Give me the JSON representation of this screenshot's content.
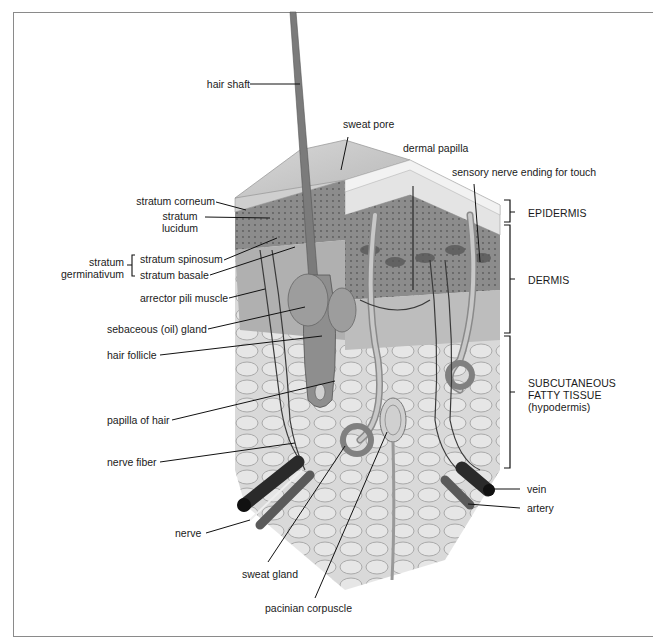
{
  "figure": {
    "style": "grayscale anatomical illustration"
  },
  "labels_left": [
    {
      "id": "hair-shaft",
      "text": "hair shaft"
    },
    {
      "id": "stratum-corneum",
      "text": "stratum corneum"
    },
    {
      "id": "stratum-lucidum",
      "line1": "stratum",
      "line2": "lucidum"
    },
    {
      "id": "stratum-germinativum",
      "line1": "stratum",
      "line2": "germinativum"
    },
    {
      "id": "stratum-spinosum",
      "text": "stratum spinosum"
    },
    {
      "id": "stratum-basale",
      "text": "stratum basale"
    },
    {
      "id": "arrector-pili-muscle",
      "text": "arrector pili muscle"
    },
    {
      "id": "sebaceous-gland",
      "text": "sebaceous (oil) gland"
    },
    {
      "id": "hair-follicle",
      "text": "hair follicle"
    },
    {
      "id": "papilla-of-hair",
      "text": "papilla of hair"
    },
    {
      "id": "nerve-fiber",
      "text": "nerve fiber"
    },
    {
      "id": "nerve",
      "text": "nerve"
    }
  ],
  "labels_top": [
    {
      "id": "sweat-pore",
      "text": "sweat pore"
    },
    {
      "id": "dermal-papilla",
      "text": "dermal papilla"
    },
    {
      "id": "sensory-nerve-ending",
      "text": "sensory nerve ending for touch"
    }
  ],
  "labels_bottom": [
    {
      "id": "sweat-gland",
      "text": "sweat gland"
    },
    {
      "id": "pacinian-corpuscle",
      "text": "pacinian corpuscle"
    }
  ],
  "layers_right": [
    {
      "id": "epidermis",
      "text": "EPIDERMIS"
    },
    {
      "id": "dermis",
      "text": "DERMIS"
    },
    {
      "id": "subcutaneous",
      "line1": "SUBCUTANEOUS",
      "line2": "FATTY TISSUE",
      "line3": "(hypodermis)"
    }
  ],
  "labels_right_vessels": [
    {
      "id": "vein",
      "text": "vein"
    },
    {
      "id": "artery",
      "text": "artery"
    }
  ],
  "colors": {
    "frame": "#8a8a8a",
    "label_text": "#1a1a1a",
    "leader_line": "#111111",
    "skin_surface": "#c9c9c9",
    "epidermis": "#9a9a9a",
    "dermis": "#b5b5b5",
    "fat": "#d6d6d6",
    "vessel": "#3a3a3a"
  }
}
